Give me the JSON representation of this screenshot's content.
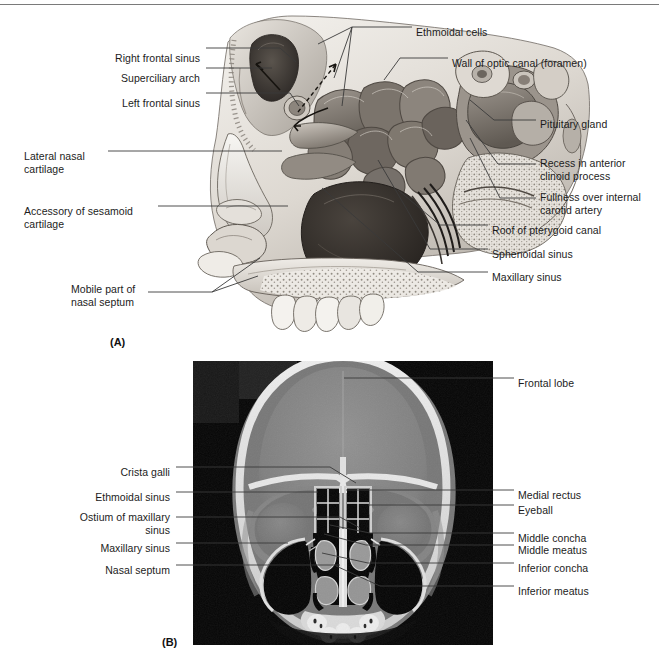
{
  "figure": {
    "panel_a_tag": "(A)",
    "panel_b_tag": "(B)",
    "panel_a_labels_left": [
      {
        "text": "Right frontal sinus",
        "align": "right",
        "x": 200,
        "y": 52
      },
      {
        "text": "Superciliary arch",
        "align": "right",
        "x": 200,
        "y": 72
      },
      {
        "text": "Left frontal sinus",
        "align": "right",
        "x": 200,
        "y": 97
      },
      {
        "text": "Lateral nasal\ncartilage",
        "align": "left",
        "x": 24,
        "y": 150
      },
      {
        "text": "Accessory of sesamoid\ncartilage",
        "align": "left",
        "x": 24,
        "y": 205
      },
      {
        "text": "Mobile part of\nnasal septum",
        "align": "left",
        "x": 71,
        "y": 283
      }
    ],
    "panel_a_labels_right": [
      {
        "text": "Ethmoidal cells",
        "align": "left",
        "x": 416,
        "y": 26
      },
      {
        "text": "Wall of optic canal (foramen)",
        "align": "left",
        "x": 452,
        "y": 57
      },
      {
        "text": "Pituitary gland",
        "align": "left",
        "x": 540,
        "y": 118
      },
      {
        "text": "Recess in anterior\nclinoid process",
        "align": "left",
        "x": 540,
        "y": 157
      },
      {
        "text": "Fullness over internal\ncarotid artery",
        "align": "left",
        "x": 540,
        "y": 191
      },
      {
        "text": "Roof of pterygoid canal",
        "align": "left",
        "x": 492,
        "y": 224
      },
      {
        "text": "Sphenoidal sinus",
        "align": "left",
        "x": 492,
        "y": 248
      },
      {
        "text": "Maxillary sinus",
        "align": "left",
        "x": 492,
        "y": 271
      }
    ],
    "panel_b_labels_left": [
      {
        "text": "Crista galli",
        "align": "right",
        "x": 170,
        "y": 466
      },
      {
        "text": "Ethmoidal sinus",
        "align": "right",
        "x": 170,
        "y": 491
      },
      {
        "text": "Ostium of maxillary\nsinus",
        "align": "right",
        "x": 170,
        "y": 511
      },
      {
        "text": "Maxillary sinus",
        "align": "right",
        "x": 170,
        "y": 542
      },
      {
        "text": "Nasal septum",
        "align": "right",
        "x": 170,
        "y": 564
      }
    ],
    "panel_b_labels_right": [
      {
        "text": "Frontal lobe",
        "align": "left",
        "x": 518,
        "y": 377
      },
      {
        "text": "Medial rectus",
        "align": "left",
        "x": 518,
        "y": 489
      },
      {
        "text": "Eyeball",
        "align": "left",
        "x": 518,
        "y": 504
      },
      {
        "text": "Middle concha",
        "align": "left",
        "x": 518,
        "y": 532
      },
      {
        "text": "Middle meatus",
        "align": "left",
        "x": 518,
        "y": 544
      },
      {
        "text": "Inferior concha",
        "align": "left",
        "x": 518,
        "y": 562
      },
      {
        "text": "Inferior meatus",
        "align": "left",
        "x": 518,
        "y": 585
      }
    ],
    "colors": {
      "rule": "#7a7a7a",
      "leader": "#3a3a3a",
      "text": "#1c1c1c",
      "ct_background": "#0a0a0a",
      "ct_soft_tissue": "#8c8c8c",
      "ct_bone": "#f2f2f2",
      "ct_air": "#050505",
      "art_light": "#eceae6",
      "art_mid": "#b9b4ae",
      "art_dark": "#6e6760",
      "art_darkest": "#3a3531"
    },
    "panel_a_image": {
      "name": "sagittal-section-nasal-cavity-illustration",
      "x": 168,
      "y": 8,
      "width": 430,
      "height": 330
    },
    "panel_b_image": {
      "name": "coronal-ct-paranasal-sinuses",
      "x": 193,
      "y": 361,
      "width": 300,
      "height": 284
    }
  }
}
